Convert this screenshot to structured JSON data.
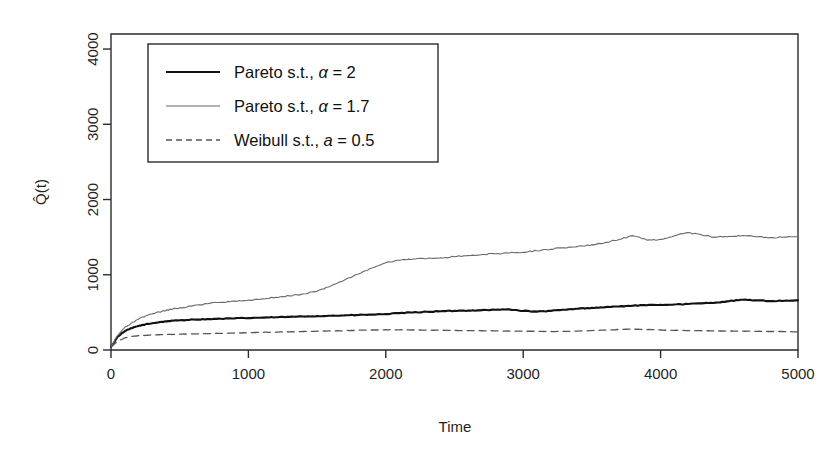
{
  "figure": {
    "background": "#ffffff",
    "plot_box": {
      "left": 111,
      "right": 798,
      "top": 34,
      "bottom": 350
    },
    "axis_color": "#2b2b2b"
  },
  "axes": {
    "x_title": "Time",
    "y_title": "Q̂(t)",
    "x_ticks": [
      "0",
      "1000",
      "2000",
      "3000",
      "4000",
      "5000"
    ],
    "y_ticks": [
      "0",
      "1000",
      "2000",
      "3000",
      "4000"
    ]
  },
  "legend": {
    "box": {
      "x": 148,
      "y": 44,
      "width": 290,
      "height": 118
    },
    "entries": [
      {
        "label_pre": "Pareto s.t., ",
        "symbol": "α",
        "label_post": " = 2",
        "style": "solid-thick",
        "color": "#111111"
      },
      {
        "label_pre": "Pareto s.t., ",
        "symbol": "α",
        "label_post": " = 1.7",
        "style": "solid-thin",
        "color": "#666666"
      },
      {
        "label_pre": "Weibull s.t., ",
        "symbol": "a",
        "label_post": " = 0.5",
        "style": "dashed",
        "color": "#555555"
      }
    ]
  },
  "chart_data": {
    "type": "line",
    "title": "",
    "xlabel": "Time",
    "ylabel": "Q̂(t)",
    "xlim": [
      0,
      5000
    ],
    "ylim": [
      0,
      4200
    ],
    "xticks": [
      0,
      1000,
      2000,
      3000,
      4000,
      5000
    ],
    "yticks": [
      0,
      1000,
      2000,
      3000,
      4000
    ],
    "grid": false,
    "legend_position": "upper-left",
    "x": [
      0,
      50,
      100,
      150,
      200,
      250,
      300,
      350,
      400,
      450,
      500,
      600,
      700,
      800,
      900,
      1000,
      1100,
      1200,
      1300,
      1400,
      1500,
      1600,
      1700,
      1800,
      1900,
      2000,
      2100,
      2200,
      2300,
      2400,
      2500,
      2600,
      2700,
      2800,
      2900,
      3000,
      3100,
      3200,
      3300,
      3400,
      3500,
      3600,
      3700,
      3800,
      3900,
      4000,
      4100,
      4200,
      4300,
      4400,
      4500,
      4600,
      4700,
      4800,
      4900,
      5000
    ],
    "series": [
      {
        "name": "Pareto s.t., α = 2",
        "style": "solid-thick",
        "color": "#111111",
        "values": [
          40,
          180,
          250,
          290,
          320,
          340,
          355,
          370,
          380,
          390,
          395,
          405,
          410,
          415,
          420,
          425,
          430,
          435,
          440,
          445,
          450,
          455,
          460,
          465,
          470,
          478,
          490,
          500,
          508,
          515,
          520,
          525,
          530,
          535,
          540,
          520,
          510,
          520,
          535,
          550,
          560,
          570,
          580,
          590,
          595,
          600,
          605,
          612,
          620,
          630,
          650,
          668,
          660,
          650,
          655,
          660
        ]
      },
      {
        "name": "Pareto s.t., α = 1.7",
        "style": "solid-thin",
        "color": "#6a6a6a",
        "values": [
          40,
          200,
          300,
          360,
          410,
          450,
          480,
          505,
          525,
          545,
          560,
          590,
          615,
          635,
          650,
          665,
          680,
          700,
          720,
          745,
          780,
          850,
          930,
          1010,
          1090,
          1160,
          1195,
          1210,
          1215,
          1225,
          1240,
          1255,
          1270,
          1280,
          1290,
          1300,
          1320,
          1340,
          1360,
          1380,
          1400,
          1430,
          1470,
          1520,
          1460,
          1470,
          1520,
          1560,
          1530,
          1500,
          1510,
          1520,
          1505,
          1495,
          1500,
          1505
        ]
      },
      {
        "name": "Weibull s.t., a = 0.5",
        "style": "dashed",
        "color": "#555555",
        "values": [
          40,
          120,
          160,
          180,
          190,
          195,
          200,
          203,
          206,
          208,
          210,
          214,
          218,
          222,
          226,
          230,
          234,
          238,
          242,
          246,
          250,
          254,
          258,
          262,
          266,
          270,
          268,
          266,
          264,
          262,
          260,
          258,
          256,
          254,
          252,
          250,
          248,
          246,
          248,
          252,
          258,
          265,
          272,
          278,
          272,
          266,
          262,
          258,
          256,
          254,
          252,
          250,
          248,
          246,
          244,
          242
        ]
      }
    ]
  }
}
